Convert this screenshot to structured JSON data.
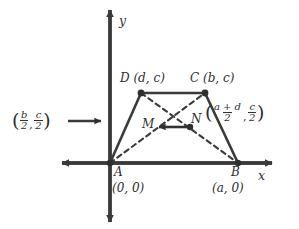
{
  "figure": {
    "type": "coordinate-geometry-diagram",
    "axes": {
      "x_label": "x",
      "y_label": "y"
    },
    "vertices": [
      {
        "name": "A",
        "coord_text": "(0, 0)",
        "x": 110,
        "y": 163
      },
      {
        "name": "B",
        "coord_text": "(a, 0)",
        "x": 238,
        "y": 163
      },
      {
        "name": "C",
        "coord_text": "(b, c)",
        "x": 205,
        "y": 93
      },
      {
        "name": "D",
        "coord_text": "(d, c)",
        "x": 141,
        "y": 93
      }
    ],
    "vertex_labels": {
      "D": "D (d, c)",
      "C": "C (b, c)",
      "A": "A",
      "A_coord": "(0, 0)",
      "B": "B",
      "B_coord": "(a, 0)"
    },
    "midpoints": [
      {
        "name": "M",
        "x": 156,
        "y": 127
      },
      {
        "name": "N",
        "x": 190,
        "y": 127
      }
    ],
    "midpoint_labels": {
      "M": "M",
      "N": "N"
    },
    "annotation_left": {
      "open_paren": "(",
      "num1": "b",
      "den1": "2",
      "comma": ",",
      "num2": "c",
      "den2": "2",
      "close_paren": ")",
      "points_to": "M"
    },
    "annotation_right": {
      "open_paren": "(",
      "num1": "a + d",
      "den1": "2",
      "comma": ",",
      "num2": "c",
      "den2": "2",
      "close_paren": ")",
      "points_to": "N"
    },
    "colors": {
      "ink": "#2f2f2f",
      "background": "#ffffff"
    }
  }
}
